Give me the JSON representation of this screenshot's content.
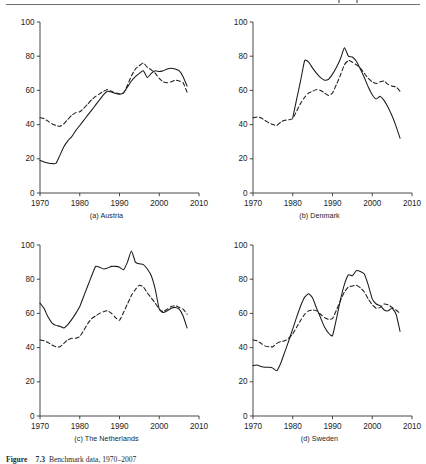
{
  "figure": {
    "caption_label": "Figure",
    "caption_number": "7.3",
    "caption_text": "Benchmark data, 1970–2007",
    "top_rule": true
  },
  "axes": {
    "y_ticks": [
      0,
      20,
      40,
      60,
      80,
      100
    ],
    "x_ticks": [
      1970,
      1980,
      1990,
      2000,
      2010
    ],
    "ylim": [
      0,
      100
    ],
    "xlim": [
      1970,
      2010
    ],
    "grid": false,
    "legend": "none"
  },
  "chart_data": [
    {
      "type": "line",
      "title": "(a) Austria",
      "xlabel": "",
      "ylabel": "",
      "xlim": [
        1970,
        2010
      ],
      "ylim": [
        0,
        100
      ],
      "xticks": [
        1970,
        1980,
        1990,
        2000,
        2010
      ],
      "yticks": [
        0,
        20,
        40,
        60,
        80,
        100
      ],
      "grid": false,
      "legend_position": "none",
      "series": [
        {
          "name": "solid",
          "style": "solid",
          "x": [
            1970,
            1971,
            1972,
            1973,
            1974,
            1975,
            1976,
            1977,
            1978,
            1979,
            1980,
            1981,
            1982,
            1983,
            1984,
            1985,
            1986,
            1987,
            1988,
            1989,
            1990,
            1991,
            1992,
            1993,
            1994,
            1995,
            1996,
            1997,
            1998,
            1999,
            2000,
            2001,
            2002,
            2003,
            2004,
            2005,
            2006,
            2007
          ],
          "values": [
            19.0,
            18.2,
            17.6,
            17.2,
            17.3,
            22.0,
            27.0,
            30.5,
            33.0,
            36.5,
            39.5,
            42.5,
            45.5,
            48.5,
            51.5,
            54.5,
            57.5,
            59.5,
            59.0,
            58.2,
            57.8,
            58.5,
            62.0,
            65.5,
            68.0,
            70.0,
            71.5,
            67.5,
            70.0,
            71.5,
            71.0,
            71.5,
            72.5,
            73.0,
            72.5,
            71.5,
            68.0,
            62.5
          ]
        },
        {
          "name": "dashed",
          "style": "dashed",
          "x": [
            1970,
            1971,
            1972,
            1973,
            1974,
            1975,
            1976,
            1977,
            1978,
            1979,
            1980,
            1981,
            1982,
            1983,
            1984,
            1985,
            1986,
            1987,
            1988,
            1989,
            1990,
            1991,
            1992,
            1993,
            1994,
            1995,
            1996,
            1997,
            1998,
            1999,
            2000,
            2001,
            2002,
            2003,
            2004,
            2005,
            2006,
            2007
          ],
          "values": [
            44.0,
            43.5,
            42.0,
            40.5,
            39.5,
            39.0,
            40.5,
            43.0,
            45.5,
            47.0,
            47.5,
            49.5,
            52.0,
            54.5,
            56.5,
            58.0,
            59.5,
            60.5,
            59.5,
            58.5,
            58.0,
            58.5,
            63.0,
            68.5,
            72.5,
            74.5,
            76.0,
            73.5,
            72.0,
            70.0,
            67.0,
            65.0,
            64.5,
            65.0,
            66.0,
            65.5,
            64.5,
            59.0
          ]
        }
      ]
    },
    {
      "type": "line",
      "title": "(b) Denmark",
      "xlabel": "",
      "ylabel": "",
      "xlim": [
        1970,
        2010
      ],
      "ylim": [
        0,
        100
      ],
      "xticks": [
        1970,
        1980,
        1990,
        2000,
        2010
      ],
      "yticks": [
        0,
        20,
        40,
        60,
        80,
        100
      ],
      "grid": false,
      "legend_position": "none",
      "series": [
        {
          "name": "solid",
          "style": "solid",
          "x": [
            1980,
            1981,
            1982,
            1983,
            1984,
            1985,
            1986,
            1987,
            1988,
            1989,
            1990,
            1991,
            1992,
            1993,
            1994,
            1995,
            1996,
            1997,
            1998,
            1999,
            2000,
            2001,
            2002,
            2003,
            2004,
            2005,
            2006,
            2007
          ],
          "values": [
            44.0,
            55.0,
            66.0,
            77.5,
            76.5,
            73.0,
            70.0,
            67.5,
            66.0,
            66.5,
            69.5,
            73.5,
            78.5,
            85.0,
            80.0,
            79.5,
            77.0,
            72.5,
            67.5,
            62.0,
            57.5,
            55.0,
            56.5,
            54.0,
            50.0,
            45.0,
            39.0,
            32.0
          ]
        },
        {
          "name": "dashed",
          "style": "dashed",
          "x": [
            1970,
            1971,
            1972,
            1973,
            1974,
            1975,
            1976,
            1977,
            1978,
            1979,
            1980,
            1981,
            1982,
            1983,
            1984,
            1985,
            1986,
            1987,
            1988,
            1989,
            1990,
            1991,
            1992,
            1993,
            1994,
            1995,
            1996,
            1997,
            1998,
            1999,
            2000,
            2001,
            2002,
            2003,
            2004,
            2005,
            2006,
            2007
          ],
          "values": [
            44.0,
            44.5,
            44.0,
            42.5,
            41.0,
            40.0,
            39.5,
            41.5,
            42.5,
            42.8,
            43.5,
            48.0,
            52.5,
            56.0,
            58.5,
            59.5,
            60.5,
            60.0,
            58.5,
            57.0,
            58.5,
            63.5,
            69.0,
            75.0,
            77.5,
            76.5,
            75.0,
            73.0,
            70.0,
            67.0,
            65.0,
            64.0,
            65.0,
            65.5,
            63.5,
            62.5,
            62.0,
            59.5
          ]
        }
      ]
    },
    {
      "type": "line",
      "title": "(c) The Netherlands",
      "xlabel": "",
      "ylabel": "",
      "xlim": [
        1970,
        2010
      ],
      "ylim": [
        0,
        100
      ],
      "xticks": [
        1970,
        1980,
        1990,
        2000,
        2010
      ],
      "yticks": [
        0,
        20,
        40,
        60,
        80,
        100
      ],
      "grid": false,
      "legend_position": "none",
      "series": [
        {
          "name": "solid",
          "style": "solid",
          "x": [
            1970,
            1971,
            1972,
            1973,
            1974,
            1975,
            1976,
            1977,
            1978,
            1979,
            1980,
            1981,
            1982,
            1983,
            1984,
            1985,
            1986,
            1987,
            1988,
            1989,
            1990,
            1991,
            1992,
            1993,
            1994,
            1995,
            1996,
            1997,
            1998,
            1999,
            2000,
            2001,
            2002,
            2003,
            2004,
            2005,
            2006,
            2007
          ],
          "values": [
            66.0,
            63.0,
            58.0,
            54.5,
            53.0,
            52.5,
            51.5,
            53.5,
            56.5,
            60.0,
            64.0,
            70.0,
            76.0,
            82.0,
            87.5,
            87.0,
            86.0,
            86.5,
            87.5,
            87.5,
            87.0,
            85.5,
            90.0,
            96.5,
            90.0,
            89.0,
            88.5,
            86.0,
            82.0,
            74.0,
            62.5,
            60.5,
            61.5,
            63.0,
            63.5,
            62.5,
            58.5,
            51.5
          ]
        },
        {
          "name": "dashed",
          "style": "dashed",
          "x": [
            1970,
            1971,
            1972,
            1973,
            1974,
            1975,
            1976,
            1977,
            1978,
            1979,
            1980,
            1981,
            1982,
            1983,
            1984,
            1985,
            1986,
            1987,
            1988,
            1989,
            1990,
            1991,
            1992,
            1993,
            1994,
            1995,
            1996,
            1997,
            1998,
            1999,
            2000,
            2001,
            2002,
            2003,
            2004,
            2005,
            2006,
            2007
          ],
          "values": [
            44.5,
            44.0,
            43.0,
            41.5,
            40.5,
            40.5,
            42.5,
            44.5,
            45.5,
            45.5,
            46.5,
            50.0,
            54.0,
            57.0,
            58.5,
            60.0,
            61.0,
            61.5,
            60.0,
            57.5,
            56.0,
            60.5,
            65.5,
            70.5,
            74.0,
            76.5,
            75.5,
            72.0,
            69.0,
            66.0,
            62.5,
            61.0,
            62.5,
            64.0,
            64.5,
            63.5,
            62.5,
            59.5
          ]
        }
      ]
    },
    {
      "type": "line",
      "title": "(d) Sweden",
      "xlabel": "",
      "ylabel": "",
      "xlim": [
        1970,
        2010
      ],
      "ylim": [
        0,
        100
      ],
      "xticks": [
        1970,
        1980,
        1990,
        2000,
        2010
      ],
      "yticks": [
        0,
        20,
        40,
        60,
        80,
        100
      ],
      "grid": false,
      "legend_position": "none",
      "series": [
        {
          "name": "solid",
          "style": "solid",
          "x": [
            1970,
            1971,
            1972,
            1973,
            1974,
            1975,
            1976,
            1977,
            1978,
            1979,
            1980,
            1981,
            1982,
            1983,
            1984,
            1985,
            1986,
            1987,
            1988,
            1989,
            1990,
            1991,
            1992,
            1993,
            1994,
            1995,
            1996,
            1997,
            1998,
            1999,
            2000,
            2001,
            2002,
            2003,
            2004,
            2005,
            2006,
            2007
          ],
          "values": [
            29.5,
            29.8,
            29.0,
            28.5,
            28.5,
            28.0,
            26.5,
            31.0,
            37.5,
            44.0,
            51.0,
            58.0,
            64.5,
            69.5,
            71.5,
            69.0,
            63.0,
            57.5,
            52.0,
            48.5,
            47.0,
            57.0,
            68.0,
            77.0,
            82.5,
            82.0,
            85.0,
            84.5,
            83.0,
            76.5,
            68.5,
            65.5,
            64.5,
            62.0,
            61.5,
            63.0,
            59.5,
            49.5
          ]
        },
        {
          "name": "dashed",
          "style": "dashed",
          "x": [
            1970,
            1971,
            1972,
            1973,
            1974,
            1975,
            1976,
            1977,
            1978,
            1979,
            1980,
            1981,
            1982,
            1983,
            1984,
            1985,
            1986,
            1987,
            1988,
            1989,
            1990,
            1991,
            1992,
            1993,
            1994,
            1995,
            1996,
            1997,
            1998,
            1999,
            2000,
            2001,
            2002,
            2003,
            2004,
            2005,
            2006,
            2007
          ],
          "values": [
            44.5,
            44.0,
            42.5,
            41.0,
            40.5,
            40.5,
            42.5,
            43.5,
            44.0,
            45.5,
            48.0,
            52.0,
            56.0,
            59.5,
            61.5,
            62.0,
            61.5,
            59.5,
            57.5,
            56.5,
            57.0,
            62.0,
            67.5,
            72.5,
            75.5,
            76.0,
            76.5,
            75.0,
            72.5,
            68.5,
            65.0,
            63.0,
            63.5,
            65.5,
            65.0,
            63.5,
            62.0,
            60.0
          ]
        }
      ]
    }
  ]
}
